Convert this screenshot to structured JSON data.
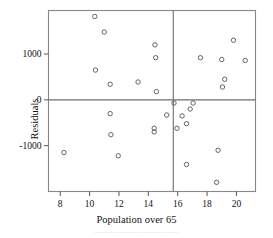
{
  "chart_data": {
    "type": "scatter",
    "title": "",
    "xlabel": "Population over 65",
    "ylabel": "Residuals",
    "xlim": [
      7.2,
      21.3
    ],
    "ylim": [
      -2000,
      1950
    ],
    "xticks": [
      8,
      10,
      12,
      14,
      16,
      18,
      20
    ],
    "xticklabels": [
      "8",
      "10",
      "12",
      "14",
      "16",
      "18",
      "20"
    ],
    "yticks": [
      1000,
      0,
      -1000
    ],
    "yticklabels": [
      "1000",
      "0",
      "-1000"
    ],
    "grid": false,
    "legend": null,
    "marker": "open-circle",
    "marker_color": "#555555",
    "reference_lines": [
      {
        "orientation": "horizontal",
        "value": 0
      },
      {
        "orientation": "vertical",
        "value": 15.7
      }
    ],
    "points": [
      {
        "x": 8.25,
        "y": -1150
      },
      {
        "x": 10.35,
        "y": 1820
      },
      {
        "x": 10.4,
        "y": 650
      },
      {
        "x": 11.0,
        "y": 1480
      },
      {
        "x": 11.4,
        "y": 340
      },
      {
        "x": 11.4,
        "y": -300
      },
      {
        "x": 11.45,
        "y": -760
      },
      {
        "x": 11.95,
        "y": -1220
      },
      {
        "x": 13.3,
        "y": 390
      },
      {
        "x": 14.4,
        "y": -620
      },
      {
        "x": 14.4,
        "y": -700
      },
      {
        "x": 14.45,
        "y": 1200
      },
      {
        "x": 14.5,
        "y": 920
      },
      {
        "x": 14.55,
        "y": 180
      },
      {
        "x": 15.25,
        "y": -330
      },
      {
        "x": 15.75,
        "y": -70
      },
      {
        "x": 15.95,
        "y": -620
      },
      {
        "x": 16.3,
        "y": -350
      },
      {
        "x": 16.6,
        "y": -520
      },
      {
        "x": 16.6,
        "y": -1410
      },
      {
        "x": 16.85,
        "y": -200
      },
      {
        "x": 17.05,
        "y": -70
      },
      {
        "x": 17.55,
        "y": 920
      },
      {
        "x": 18.65,
        "y": -1800
      },
      {
        "x": 18.75,
        "y": -1100
      },
      {
        "x": 19.0,
        "y": 880
      },
      {
        "x": 19.05,
        "y": 280
      },
      {
        "x": 19.2,
        "y": 450
      },
      {
        "x": 19.8,
        "y": 1300
      },
      {
        "x": 20.6,
        "y": 860
      }
    ]
  },
  "caption": {
    "text": "····································"
  }
}
